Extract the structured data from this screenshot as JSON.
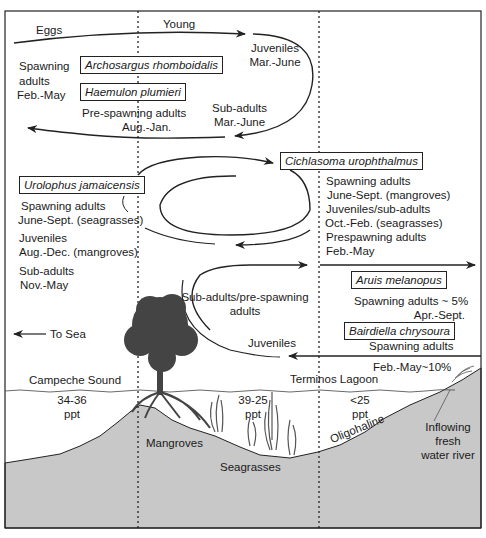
{
  "colors": {
    "line": "#222222",
    "ground": "#c8c8c8",
    "tree": "#444444",
    "background": "#ffffff"
  },
  "zones": {
    "dividers": [
      "dotted-line-mangrove",
      "dotted-line-lagoon"
    ]
  },
  "top_cycle": {
    "eggs": "Eggs",
    "young": "Young",
    "juveniles": "Juveniles",
    "juveniles_months": "Mar.-June",
    "spawning_adults_1": "Spawning",
    "spawning_adults_2": "adults",
    "spawning_adults_months": "Feb.-May",
    "species": [
      "Archosargus rhomboidalis",
      "Haemulon plumieri"
    ],
    "pre_spawning": "Pre-spawning adults",
    "pre_spawning_months": "Aug.-Jan.",
    "sub_adults": "Sub-adults",
    "sub_adults_months": "Mar.-June"
  },
  "middle_cycle": {
    "species_left": "Urolophus jamaicensis",
    "species_right": "Cichlasoma urophthalmus",
    "left_lines": [
      "Spawning adults",
      "June-Sept. (seagrasses)",
      "Juveniles",
      "Aug.-Dec. (mangroves)",
      "Sub-adults",
      "Nov.-May"
    ],
    "right_lines": [
      "Spawning adults",
      "June-Sept. (mangroves)",
      "Juveniles/sub-adults",
      "Oct.-Feb. (seagrasses)",
      "Prespawning adults",
      "Feb.-May"
    ]
  },
  "bottom_cycle": {
    "sub_adults_1": "Sub-adults/pre-spawning",
    "sub_adults_2": "adults",
    "juveniles": "Juveniles",
    "species": [
      "Aruis melanopus",
      "Bairdiella chrysoura"
    ],
    "aruis_1": "Spawning adults ~ 5%",
    "aruis_2": "Apr.-Sept.",
    "bairdiella_1": "Spawning adults",
    "bairdiella_2": "Feb.-May~10%"
  },
  "landscape": {
    "to_sea": "To Sea",
    "campeche": "Campeche Sound",
    "terminos": "Terminos Lagoon",
    "salinity": [
      {
        "value": "34-36",
        "unit": "ppt"
      },
      {
        "value": "39-25",
        "unit": "ppt"
      },
      {
        "value": "<25",
        "unit": "ppt"
      }
    ],
    "mangroves": "Mangroves",
    "seagrasses": "Seagrasses",
    "oligohaline": "Oligohaline",
    "river_1": "Inflowing",
    "river_2": "fresh",
    "river_3": "water river"
  }
}
